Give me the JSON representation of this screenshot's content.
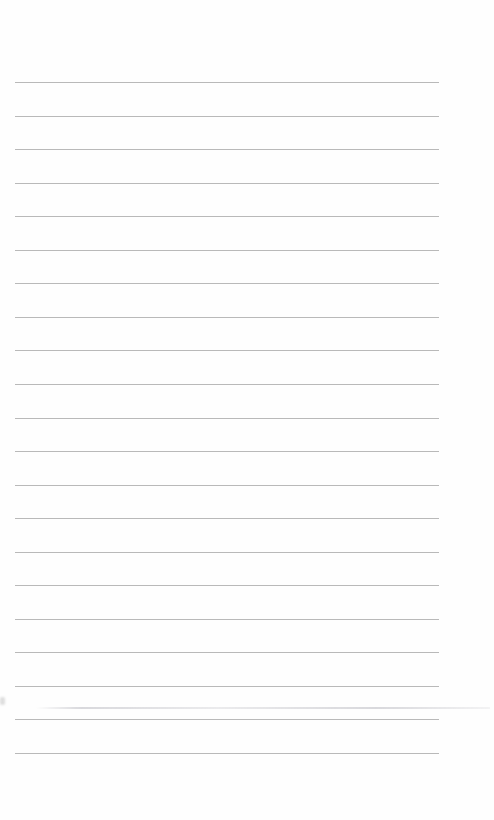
{
  "page": {
    "type": "lined-paper",
    "background": "#fefefe",
    "rule_color": "#b9b9b9",
    "rule_count": 21,
    "rule_left": 15,
    "rule_width": 424,
    "first_rule_y": 82,
    "rule_spacing": 33.55
  }
}
